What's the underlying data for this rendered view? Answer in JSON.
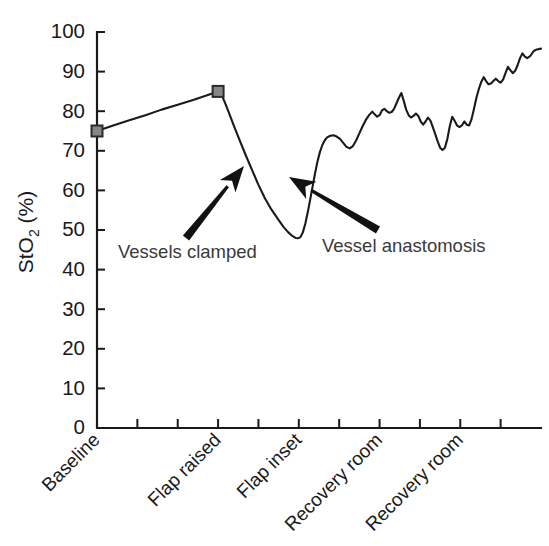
{
  "chart_data": {
    "type": "line",
    "title": "",
    "xlabel": "",
    "ylabel": "StO2 (%)",
    "ylabel_base": "StO",
    "ylabel_sub": "2",
    "ylabel_unit": " (%)",
    "ylim": [
      0,
      100
    ],
    "ytick_labels": [
      "0",
      "10",
      "20",
      "30",
      "40",
      "50",
      "60",
      "70",
      "80",
      "90",
      "100"
    ],
    "ytick_values": [
      0,
      10,
      20,
      30,
      40,
      50,
      60,
      70,
      80,
      90,
      100
    ],
    "grid": false,
    "legend": "none",
    "categories": [
      "Baseline",
      "Flap raised",
      "Flap inset",
      "Recovery room",
      "Recovery room"
    ],
    "xtick_category_positions": [
      0,
      3,
      5,
      7,
      9
    ],
    "xtick_count": 11,
    "marker_points": [
      {
        "label": "Baseline",
        "x": 0.0,
        "value": 75
      },
      {
        "label": "Flap raised",
        "x": 3.0,
        "value": 85
      }
    ],
    "series": [
      {
        "name": "StO2",
        "marker": "square",
        "color": "#1a1a1a",
        "points": [
          [
            0.0,
            75.0
          ],
          [
            0.4,
            76.4
          ],
          [
            0.8,
            77.7
          ],
          [
            1.2,
            79.0
          ],
          [
            1.6,
            80.4
          ],
          [
            2.0,
            81.6
          ],
          [
            2.4,
            82.9
          ],
          [
            2.8,
            84.3
          ],
          [
            3.0,
            85.0
          ],
          [
            3.08,
            84.3
          ],
          [
            3.16,
            82.4
          ],
          [
            3.26,
            79.8
          ],
          [
            3.38,
            76.6
          ],
          [
            3.52,
            73.0
          ],
          [
            3.68,
            69.0
          ],
          [
            3.84,
            65.2
          ],
          [
            4.0,
            61.4
          ],
          [
            4.16,
            58.0
          ],
          [
            4.32,
            55.2
          ],
          [
            4.48,
            52.8
          ],
          [
            4.62,
            50.8
          ],
          [
            4.74,
            49.4
          ],
          [
            4.84,
            48.5
          ],
          [
            4.92,
            48.0
          ],
          [
            4.98,
            47.9
          ],
          [
            5.04,
            48.2
          ],
          [
            5.1,
            49.4
          ],
          [
            5.16,
            51.6
          ],
          [
            5.22,
            54.4
          ],
          [
            5.28,
            57.6
          ],
          [
            5.34,
            60.9
          ],
          [
            5.4,
            64.2
          ],
          [
            5.46,
            67.2
          ],
          [
            5.52,
            69.6
          ],
          [
            5.58,
            71.4
          ],
          [
            5.64,
            72.6
          ],
          [
            5.7,
            73.4
          ],
          [
            5.78,
            73.8
          ],
          [
            5.86,
            73.9
          ],
          [
            5.94,
            73.6
          ],
          [
            6.02,
            73.0
          ],
          [
            6.1,
            72.0
          ],
          [
            6.18,
            71.0
          ],
          [
            6.26,
            70.6
          ],
          [
            6.34,
            71.2
          ],
          [
            6.42,
            72.6
          ],
          [
            6.5,
            74.4
          ],
          [
            6.58,
            76.2
          ],
          [
            6.66,
            77.8
          ],
          [
            6.74,
            79.0
          ],
          [
            6.82,
            79.9
          ],
          [
            6.88,
            79.2
          ],
          [
            6.94,
            78.6
          ],
          [
            7.0,
            79.0
          ],
          [
            7.06,
            80.2
          ],
          [
            7.12,
            80.6
          ],
          [
            7.18,
            80.0
          ],
          [
            7.24,
            79.6
          ],
          [
            7.3,
            79.8
          ],
          [
            7.36,
            80.6
          ],
          [
            7.42,
            82.0
          ],
          [
            7.48,
            83.4
          ],
          [
            7.54,
            84.6
          ],
          [
            7.6,
            82.6
          ],
          [
            7.66,
            80.4
          ],
          [
            7.72,
            79.0
          ],
          [
            7.78,
            78.4
          ],
          [
            7.84,
            78.8
          ],
          [
            7.9,
            79.4
          ],
          [
            7.96,
            78.8
          ],
          [
            8.02,
            77.4
          ],
          [
            8.08,
            76.6
          ],
          [
            8.14,
            77.4
          ],
          [
            8.2,
            78.4
          ],
          [
            8.26,
            77.6
          ],
          [
            8.32,
            76.0
          ],
          [
            8.38,
            74.2
          ],
          [
            8.44,
            72.4
          ],
          [
            8.5,
            70.8
          ],
          [
            8.56,
            70.2
          ],
          [
            8.62,
            70.8
          ],
          [
            8.68,
            73.0
          ],
          [
            8.74,
            76.2
          ],
          [
            8.8,
            78.6
          ],
          [
            8.86,
            77.6
          ],
          [
            8.92,
            76.4
          ],
          [
            8.98,
            76.0
          ],
          [
            9.04,
            76.4
          ],
          [
            9.1,
            77.4
          ],
          [
            9.16,
            76.6
          ],
          [
            9.22,
            76.4
          ],
          [
            9.28,
            78.0
          ],
          [
            9.34,
            80.6
          ],
          [
            9.4,
            83.4
          ],
          [
            9.46,
            85.6
          ],
          [
            9.52,
            87.4
          ],
          [
            9.58,
            88.6
          ],
          [
            9.64,
            87.6
          ],
          [
            9.7,
            86.8
          ],
          [
            9.76,
            87.0
          ],
          [
            9.82,
            87.6
          ],
          [
            9.88,
            88.2
          ],
          [
            9.94,
            87.6
          ],
          [
            10.0,
            87.2
          ],
          [
            10.06,
            88.0
          ],
          [
            10.12,
            89.6
          ],
          [
            10.18,
            91.2
          ],
          [
            10.24,
            90.4
          ],
          [
            10.3,
            89.6
          ],
          [
            10.36,
            90.2
          ],
          [
            10.42,
            91.6
          ],
          [
            10.48,
            93.4
          ],
          [
            10.54,
            94.6
          ],
          [
            10.6,
            93.8
          ],
          [
            10.66,
            93.4
          ],
          [
            10.74,
            94.0
          ],
          [
            10.82,
            95.2
          ],
          [
            10.9,
            95.6
          ],
          [
            11.0,
            95.8
          ]
        ]
      }
    ],
    "annotations": [
      {
        "id": "vessels-clamped",
        "text": "Vessels clamped",
        "text_x": 118,
        "text_y": 258,
        "arrow_tail_x": 186,
        "arrow_tail_y": 238,
        "arrow_tip_x": 244,
        "arrow_tip_y": 166
      },
      {
        "id": "vessel-anastomosis",
        "text": "Vessel anastomosis",
        "text_x": 322,
        "text_y": 252,
        "arrow_tail_x": 378,
        "arrow_tail_y": 230,
        "arrow_tip_x": 289,
        "arrow_tip_y": 177
      }
    ]
  }
}
